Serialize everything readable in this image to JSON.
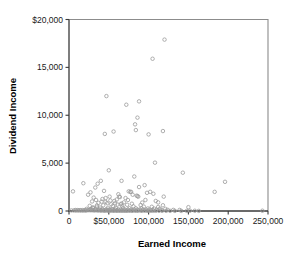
{
  "chart_data": {
    "type": "scatter",
    "title": "",
    "xlabel": "Earned Income",
    "ylabel": "Dividend Income",
    "xlim": [
      0,
      250000
    ],
    "ylim": [
      0,
      20000
    ],
    "grid": false,
    "legend": null,
    "marker": "open-circle",
    "marker_color": "#9a9a9a",
    "xticks": [
      0,
      50000,
      100000,
      150000,
      200000,
      250000
    ],
    "xtick_labels": [
      "0",
      "$50,000",
      "100,000",
      "150,000",
      "200,000",
      "250,000"
    ],
    "yticks": [
      0,
      5000,
      10000,
      15000,
      20000
    ],
    "ytick_labels": [
      "0",
      "5,000",
      "10,000",
      "15,000",
      "$20,000"
    ],
    "points": [
      [
        120000,
        17900
      ],
      [
        105000,
        15900
      ],
      [
        47000,
        12000
      ],
      [
        88000,
        11450
      ],
      [
        72000,
        11100
      ],
      [
        86000,
        9750
      ],
      [
        83000,
        9050
      ],
      [
        84000,
        8450
      ],
      [
        118000,
        8350
      ],
      [
        56000,
        8300
      ],
      [
        45000,
        8050
      ],
      [
        100000,
        8000
      ],
      [
        108000,
        5050
      ],
      [
        143000,
        4000
      ],
      [
        50000,
        4250
      ],
      [
        82000,
        3600
      ],
      [
        196000,
        3050
      ],
      [
        40000,
        3150
      ],
      [
        66000,
        3150
      ],
      [
        18000,
        2900
      ],
      [
        36000,
        2850
      ],
      [
        95000,
        2700
      ],
      [
        88000,
        2500
      ],
      [
        33000,
        2450
      ],
      [
        5000,
        2050
      ],
      [
        75000,
        2050
      ],
      [
        77000,
        2000
      ],
      [
        78000,
        2000
      ],
      [
        102000,
        2000
      ],
      [
        183000,
        2000
      ],
      [
        27000,
        1950
      ],
      [
        44000,
        2100
      ],
      [
        98000,
        1900
      ],
      [
        106000,
        1800
      ],
      [
        62000,
        1750
      ],
      [
        24000,
        1700
      ],
      [
        85000,
        1600
      ],
      [
        86000,
        1550
      ],
      [
        87000,
        1500
      ],
      [
        63000,
        1500
      ],
      [
        119000,
        1500
      ],
      [
        64000,
        1450
      ],
      [
        31000,
        1400
      ],
      [
        71000,
        1350
      ],
      [
        109000,
        1050
      ],
      [
        34000,
        1150
      ],
      [
        52000,
        1100
      ],
      [
        57000,
        1050
      ],
      [
        29000,
        1000
      ],
      [
        41000,
        980
      ],
      [
        46000,
        950
      ],
      [
        69000,
        900
      ],
      [
        92000,
        880
      ],
      [
        37000,
        850
      ],
      [
        48000,
        820
      ],
      [
        58000,
        800
      ],
      [
        66000,
        780
      ],
      [
        79000,
        760
      ],
      [
        53000,
        700
      ],
      [
        61000,
        680
      ],
      [
        73000,
        650
      ],
      [
        90000,
        620
      ],
      [
        43000,
        600
      ],
      [
        35000,
        580
      ],
      [
        26000,
        540
      ],
      [
        55000,
        520
      ],
      [
        67000,
        500
      ],
      [
        81000,
        480
      ],
      [
        94000,
        460
      ],
      [
        104000,
        440
      ],
      [
        112000,
        420
      ],
      [
        150000,
        400
      ],
      [
        30000,
        380
      ],
      [
        39000,
        360
      ],
      [
        49000,
        340
      ],
      [
        59000,
        320
      ],
      [
        68000,
        300
      ],
      [
        76000,
        290
      ],
      [
        84000,
        280
      ],
      [
        91000,
        270
      ],
      [
        99000,
        260
      ],
      [
        107000,
        250
      ],
      [
        114000,
        240
      ],
      [
        121000,
        230
      ],
      [
        22000,
        220
      ],
      [
        28000,
        210
      ],
      [
        33000,
        200
      ],
      [
        38000,
        195
      ],
      [
        42000,
        190
      ],
      [
        47000,
        185
      ],
      [
        51000,
        180
      ],
      [
        54000,
        175
      ],
      [
        58000,
        170
      ],
      [
        62000,
        165
      ],
      [
        65000,
        160
      ],
      [
        70000,
        155
      ],
      [
        74000,
        150
      ],
      [
        78000,
        148
      ],
      [
        82000,
        145
      ],
      [
        86000,
        142
      ],
      [
        89000,
        140
      ],
      [
        93000,
        138
      ],
      [
        97000,
        135
      ],
      [
        101000,
        132
      ],
      [
        105000,
        130
      ],
      [
        110000,
        128
      ],
      [
        116000,
        125
      ],
      [
        124000,
        120
      ],
      [
        131000,
        115
      ],
      [
        139000,
        110
      ],
      [
        8000,
        100
      ],
      [
        11000,
        95
      ],
      [
        14000,
        92
      ],
      [
        17000,
        90
      ],
      [
        20000,
        88
      ],
      [
        23000,
        85
      ],
      [
        25000,
        82
      ],
      [
        27000,
        80
      ],
      [
        29000,
        78
      ],
      [
        31000,
        76
      ],
      [
        32000,
        74
      ],
      [
        34000,
        72
      ],
      [
        36000,
        70
      ],
      [
        37000,
        68
      ],
      [
        39000,
        66
      ],
      [
        40000,
        64
      ],
      [
        41000,
        62
      ],
      [
        43000,
        60
      ],
      [
        44000,
        58
      ],
      [
        45000,
        56
      ],
      [
        46000,
        55
      ],
      [
        48000,
        54
      ],
      [
        49000,
        52
      ],
      [
        50000,
        51
      ],
      [
        52000,
        50
      ],
      [
        53000,
        49
      ],
      [
        55000,
        48
      ],
      [
        56000,
        47
      ],
      [
        57000,
        46
      ],
      [
        59000,
        45
      ],
      [
        60000,
        44
      ],
      [
        61000,
        43
      ],
      [
        63000,
        42
      ],
      [
        64000,
        41
      ],
      [
        66000,
        40
      ],
      [
        67000,
        39
      ],
      [
        69000,
        38
      ],
      [
        70000,
        37
      ],
      [
        72000,
        36
      ],
      [
        73000,
        35
      ],
      [
        75000,
        34
      ],
      [
        77000,
        33
      ],
      [
        79000,
        32
      ],
      [
        80000,
        31
      ],
      [
        83000,
        30
      ],
      [
        85000,
        29
      ],
      [
        87000,
        28
      ],
      [
        90000,
        27
      ],
      [
        92000,
        26
      ],
      [
        95000,
        25
      ],
      [
        98000,
        24
      ],
      [
        100000,
        23
      ],
      [
        103000,
        22
      ],
      [
        106000,
        21
      ],
      [
        109000,
        20
      ],
      [
        113000,
        19
      ],
      [
        117000,
        18
      ],
      [
        122000,
        17
      ],
      [
        127000,
        16
      ],
      [
        133000,
        15
      ],
      [
        141000,
        14
      ],
      [
        148000,
        13
      ],
      [
        152000,
        30
      ],
      [
        158000,
        25
      ],
      [
        163000,
        12
      ],
      [
        243000,
        30
      ],
      [
        3000,
        60
      ],
      [
        6000,
        55
      ],
      [
        9000,
        50
      ],
      [
        12000,
        48
      ],
      [
        15000,
        46
      ],
      [
        18000,
        44
      ],
      [
        21000,
        42
      ],
      [
        26000,
        150
      ],
      [
        30000,
        300
      ],
      [
        35000,
        450
      ],
      [
        42000,
        1250
      ],
      [
        46000,
        1350
      ],
      [
        51000,
        1500
      ],
      [
        60000,
        1200
      ],
      [
        65000,
        700
      ],
      [
        74000,
        1150
      ],
      [
        80000,
        1700
      ],
      [
        96000,
        1150
      ],
      [
        112000,
        900
      ],
      [
        118000,
        600
      ]
    ]
  }
}
